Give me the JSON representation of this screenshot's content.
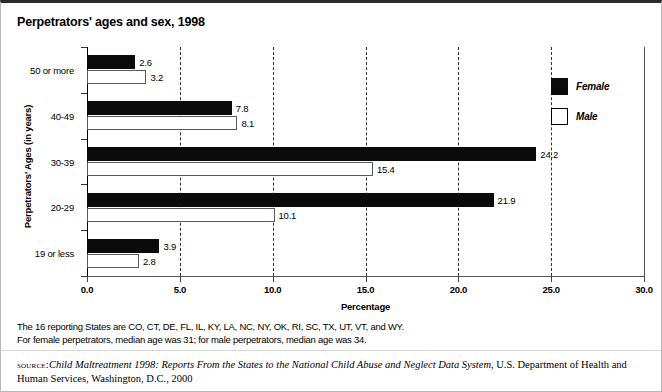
{
  "chart_data": {
    "type": "bar",
    "orientation": "horizontal",
    "title": "Perpetrators' ages and sex, 1998",
    "xlabel": "Percentage",
    "ylabel": "Perpetrators' Ages (in years)",
    "xlim": [
      0.0,
      30.0
    ],
    "xticks": [
      "0.0",
      "5.0",
      "10.0",
      "15.0",
      "20.0",
      "25.0",
      "30.0"
    ],
    "xtick_values": [
      0,
      5,
      10,
      15,
      20,
      25,
      30
    ],
    "grid": "vertical-dashed",
    "legend_position": "top-right",
    "categories": [
      "19 or less",
      "20-29",
      "30-39",
      "40-49",
      "50 or more"
    ],
    "series": [
      {
        "name": "Female",
        "color": "#0b0b0b",
        "values": [
          3.9,
          21.9,
          24.2,
          7.8,
          2.6
        ]
      },
      {
        "name": "Male",
        "color": "#ffffff",
        "values": [
          2.8,
          10.1,
          15.4,
          8.1,
          3.2
        ]
      }
    ],
    "rows_top_to_bottom": [
      {
        "category": "50 or more",
        "female": 2.6,
        "male": 3.2
      },
      {
        "category": "40-49",
        "female": 7.8,
        "male": 8.1
      },
      {
        "category": "30-39",
        "female": 24.2,
        "male": 15.4
      },
      {
        "category": "20-29",
        "female": 21.9,
        "male": 10.1
      },
      {
        "category": "19 or less",
        "female": 3.9,
        "male": 2.8
      }
    ]
  },
  "legend": {
    "items": [
      {
        "label": "Female",
        "style": "filled"
      },
      {
        "label": "Male",
        "style": "outlined"
      }
    ]
  },
  "notes": {
    "line1": "The 16 reporting States are CO, CT, DE, FL, IL, KY, LA, NC, NY, OK, RI, SC, TX, UT, VT, and WY.",
    "line2": "For female perpetrators, median age was 31; for male perpetrators, median age was 34."
  },
  "source": {
    "label": "source:",
    "title": "Child Maltreatment 1998: Reports From the States to the National Child Abuse and Neglect Data System",
    "rest": ", U.S. Department of Health and Human Services, Washington, D.C., 2000"
  }
}
